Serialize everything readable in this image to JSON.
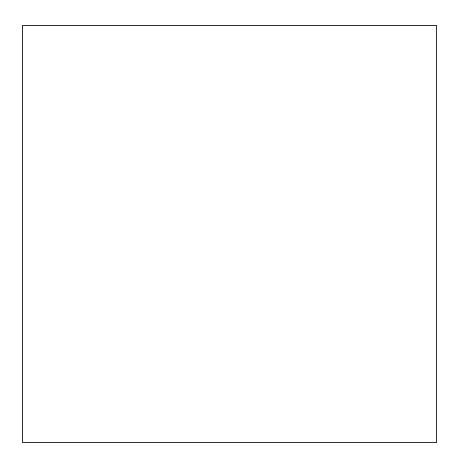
{
  "diagram": {
    "title": "",
    "axis_label": "t",
    "levels": [
      {
        "level": 4,
        "variant": "fine",
        "labels": [
          "d4,0",
          "d4,1",
          "d4,2",
          "d4,3",
          "d4,4",
          "d4,5",
          "d4,6",
          "d4,7",
          "d4,8",
          "d4,9",
          "d4,10",
          "d4,11",
          "d4,12",
          "d4,13",
          "d4,14",
          "d4,15",
          "d4,16",
          "d4,17",
          "d4,18",
          "d4,19",
          "d4,20",
          "d4,21",
          "d4,22",
          "d4,23",
          "d4,24",
          "d4,25",
          "d4,26",
          "d4,27",
          "d4,28",
          "d4,29",
          "d4,30",
          "d4,31"
        ]
      },
      {
        "level": 4,
        "variant": "coarse",
        "labels": [
          "d4,0",
          "d4,1",
          "d4,2",
          "d4,3",
          "d4,4",
          "d4,5",
          "d4,6",
          "d4,7",
          "d4,8",
          "d4,9",
          "d4,10",
          "d4,11",
          "d4,12",
          "d4,13",
          "d4,14",
          "d4,15"
        ]
      },
      {
        "level": 3,
        "labels": [
          "d3,0",
          "d3,1",
          "d3,2",
          "d3,3",
          "d3,4",
          "d3,5",
          "d3,6",
          "d3,7"
        ]
      },
      {
        "level": 2,
        "labels": [
          "d2,0",
          "d2,1",
          "d2,2",
          "d2,3"
        ]
      },
      {
        "level": 1,
        "labels": [
          "d1,0",
          "d1,1"
        ]
      },
      {
        "level": 0,
        "labels": [
          "d0,0"
        ]
      }
    ],
    "row_heights_px": [
      211,
      103,
      51,
      25,
      14,
      14
    ]
  }
}
